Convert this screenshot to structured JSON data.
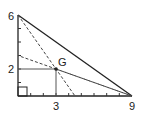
{
  "diagram": {
    "vertices": [
      [
        0,
        0
      ],
      [
        0,
        6
      ],
      [
        9,
        0
      ]
    ],
    "centroid": {
      "label": "G",
      "x": 3,
      "y": 2
    },
    "labels": {
      "y_top": "6",
      "y_mid": "2",
      "x_mid": "3",
      "x_right": "9",
      "centroid": "G"
    },
    "x_ticks": 9,
    "y_ticks": 6,
    "colors": {
      "line": "#222222",
      "dashed": "#444444",
      "guide": "#555555"
    }
  }
}
